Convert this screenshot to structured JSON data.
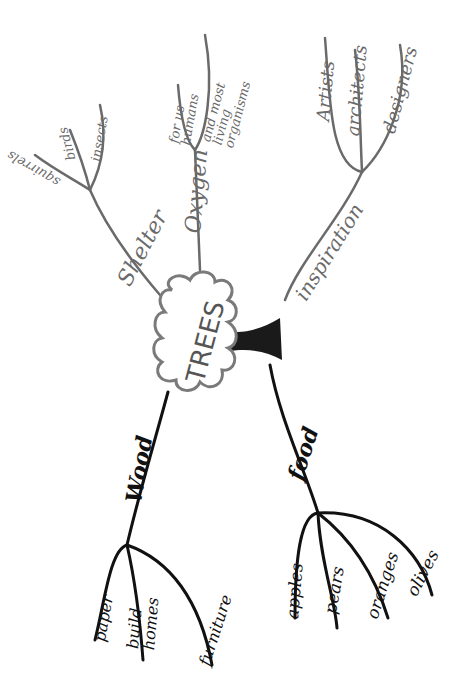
{
  "diagram": {
    "type": "mind-map",
    "orientation": "rotated 90deg counter-clockwise",
    "central_node": {
      "label": "TREES",
      "color": "#7a7a7a"
    },
    "branches": [
      {
        "label": "Shelter",
        "color": "#6a6a6a",
        "children": [
          "squirrels",
          "birds",
          "insects"
        ]
      },
      {
        "label": "Oxygen",
        "color": "#6a6a6a",
        "children": [
          "for us humans",
          "and most living organisms"
        ]
      },
      {
        "label": "inspiration",
        "color": "#6a6a6a",
        "children": [
          "Artists",
          "architects",
          "designers"
        ]
      },
      {
        "label": "Wood",
        "color": "#111111",
        "children": [
          "paper",
          "build homes",
          "furniture"
        ]
      },
      {
        "label": "food",
        "color": "#111111",
        "children": [
          "apples",
          "pears",
          "oranges",
          "olives"
        ]
      }
    ]
  }
}
